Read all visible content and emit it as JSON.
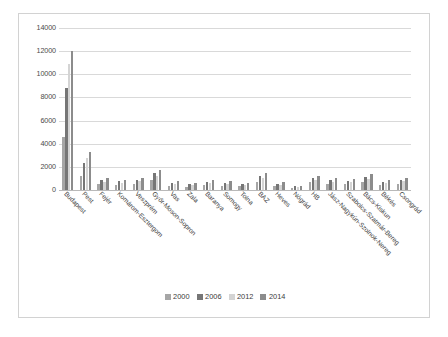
{
  "chart_data": {
    "type": "bar",
    "title": "",
    "xlabel": "",
    "ylabel": "",
    "ylim": [
      0,
      14000
    ],
    "ytick_labels": [
      "14000",
      "12000",
      "10000",
      "8000",
      "6000",
      "4000",
      "2000",
      "0"
    ],
    "yticks": [
      14000,
      12000,
      10000,
      8000,
      6000,
      4000,
      2000,
      0
    ],
    "grid": true,
    "legend_position": "bottom",
    "categories": [
      "Budapest",
      "Pest",
      "Fejér",
      "Komárom-Esztergom",
      "Veszprém",
      "Győr-Moson-Sopron",
      "Vas",
      "Zala",
      "Baranya",
      "Somogy",
      "Tolna",
      "BAZ",
      "Heves",
      "Nógrád",
      "HB",
      "Jász-Nagykún-Szolnok-Nereg",
      "Szabolcs-Szatmár-Bereg",
      "Bács-Kiskun",
      "Békés",
      "Csongrád"
    ],
    "series": [
      {
        "name": "2000",
        "color": "#a6a6a6",
        "values": [
          4600,
          1250,
          520,
          420,
          560,
          900,
          380,
          300,
          430,
          380,
          320,
          700,
          330,
          210,
          650,
          540,
          480,
          700,
          420,
          560
        ]
      },
      {
        "name": "2006",
        "color": "#767676",
        "values": [
          8800,
          2300,
          850,
          760,
          900,
          1450,
          640,
          520,
          700,
          640,
          520,
          1200,
          560,
          330,
          1050,
          880,
          800,
          1150,
          700,
          900
        ]
      },
      {
        "name": "2012",
        "color": "#d4d4d4",
        "values": [
          10900,
          2750,
          700,
          620,
          760,
          1200,
          520,
          420,
          580,
          520,
          430,
          1000,
          450,
          270,
          880,
          720,
          660,
          950,
          580,
          740
        ]
      },
      {
        "name": "2014",
        "color": "#8c8c8c",
        "values": [
          12000,
          3300,
          1000,
          880,
          1050,
          1750,
          760,
          620,
          830,
          760,
          620,
          1450,
          660,
          390,
          1250,
          1050,
          950,
          1350,
          830,
          1080
        ]
      }
    ]
  },
  "legend": {
    "items": [
      {
        "label": "2000",
        "color": "#a6a6a6"
      },
      {
        "label": "2006",
        "color": "#767676"
      },
      {
        "label": "2012",
        "color": "#d4d4d4"
      },
      {
        "label": "2014",
        "color": "#8c8c8c"
      }
    ]
  }
}
